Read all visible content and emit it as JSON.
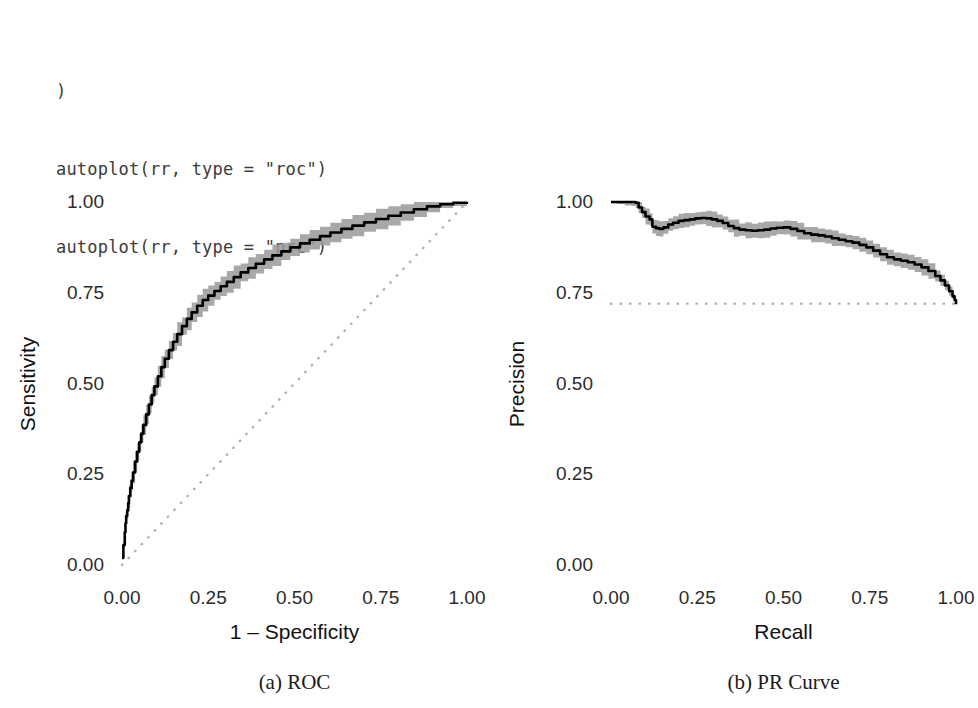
{
  "code": {
    "lines": [
      ")",
      "autoplot(rr, type = \"roc\")",
      "autoplot(rr, type = \"prc\")"
    ]
  },
  "colors": {
    "line": "#000000",
    "ribbon": "#999999",
    "reference_line": "#b0b0b0",
    "text": "#2b2b2b",
    "code_text": "#3b3b3b",
    "background": "#ffffff"
  },
  "figure": {
    "subcaptions": [
      {
        "label": "(a) ROC"
      },
      {
        "label": "(b) PR Curve"
      }
    ]
  },
  "chart_data": [
    {
      "type": "line",
      "panel": "a",
      "title": "(a) ROC",
      "xlabel": "1 – Specificity",
      "ylabel": "Sensitivity",
      "xlim": [
        0,
        1
      ],
      "ylim": [
        0,
        1
      ],
      "xticks": [
        "0.00",
        "0.25",
        "0.50",
        "0.75",
        "1.00"
      ],
      "yticks": [
        "0.00",
        "0.25",
        "0.50",
        "0.75",
        "1.00"
      ],
      "xtick_values": [
        0,
        0.25,
        0.5,
        0.75,
        1
      ],
      "ytick_values": [
        0,
        0.25,
        0.5,
        0.75,
        1
      ],
      "grid": false,
      "legend": "none",
      "reference_line": {
        "style": "dotted",
        "from": [
          0,
          0
        ],
        "to": [
          1,
          1
        ],
        "note": "chance diagonal"
      },
      "series": [
        {
          "name": "ROC curve",
          "style": "solid-black-with-grey-ribbon",
          "x": [
            0.0,
            0.004,
            0.008,
            0.01,
            0.012,
            0.015,
            0.018,
            0.02,
            0.024,
            0.028,
            0.032,
            0.038,
            0.044,
            0.05,
            0.056,
            0.062,
            0.07,
            0.078,
            0.086,
            0.094,
            0.104,
            0.114,
            0.124,
            0.136,
            0.148,
            0.16,
            0.174,
            0.188,
            0.202,
            0.218,
            0.234,
            0.25,
            0.268,
            0.286,
            0.304,
            0.324,
            0.344,
            0.366,
            0.388,
            0.412,
            0.436,
            0.462,
            0.488,
            0.516,
            0.544,
            0.574,
            0.604,
            0.636,
            0.668,
            0.702,
            0.736,
            0.772,
            0.808,
            0.846,
            0.884,
            0.922,
            0.96,
            1.0
          ],
          "y": [
            0.02,
            0.055,
            0.09,
            0.115,
            0.135,
            0.15,
            0.17,
            0.19,
            0.212,
            0.232,
            0.255,
            0.285,
            0.312,
            0.338,
            0.362,
            0.386,
            0.415,
            0.442,
            0.468,
            0.492,
            0.52,
            0.545,
            0.568,
            0.592,
            0.615,
            0.636,
            0.658,
            0.678,
            0.696,
            0.714,
            0.73,
            0.742,
            0.755,
            0.768,
            0.78,
            0.793,
            0.806,
            0.818,
            0.83,
            0.842,
            0.853,
            0.864,
            0.875,
            0.886,
            0.896,
            0.906,
            0.916,
            0.926,
            0.935,
            0.944,
            0.953,
            0.962,
            0.971,
            0.98,
            0.988,
            0.994,
            0.998,
            1.0
          ],
          "ribbon_halfwidth": 0.028
        }
      ]
    },
    {
      "type": "line",
      "panel": "b",
      "title": "(b) PR Curve",
      "xlabel": "Recall",
      "ylabel": "Precision",
      "xlim": [
        0,
        1
      ],
      "ylim": [
        0,
        1
      ],
      "xticks": [
        "0.00",
        "0.25",
        "0.50",
        "0.75",
        "1.00"
      ],
      "yticks": [
        "0.00",
        "0.25",
        "0.50",
        "0.75",
        "1.00"
      ],
      "xtick_values": [
        0,
        0.25,
        0.5,
        0.75,
        1
      ],
      "ytick_values": [
        0,
        0.25,
        0.5,
        0.75,
        1
      ],
      "grid": false,
      "legend": "none",
      "reference_line": {
        "style": "dotted",
        "from": [
          0,
          0.72
        ],
        "to": [
          1,
          0.72
        ],
        "note": "baseline prevalence"
      },
      "series": [
        {
          "name": "Precision-Recall curve",
          "style": "solid-black-with-grey-ribbon",
          "x": [
            0.0,
            0.02,
            0.04,
            0.06,
            0.072,
            0.08,
            0.09,
            0.1,
            0.112,
            0.12,
            0.13,
            0.14,
            0.152,
            0.166,
            0.18,
            0.196,
            0.212,
            0.228,
            0.244,
            0.26,
            0.276,
            0.292,
            0.308,
            0.324,
            0.34,
            0.356,
            0.372,
            0.39,
            0.408,
            0.426,
            0.444,
            0.462,
            0.48,
            0.5,
            0.52,
            0.54,
            0.56,
            0.58,
            0.6,
            0.62,
            0.64,
            0.66,
            0.68,
            0.7,
            0.72,
            0.74,
            0.76,
            0.78,
            0.8,
            0.82,
            0.84,
            0.86,
            0.88,
            0.9,
            0.92,
            0.94,
            0.955,
            0.968,
            0.98,
            0.99,
            0.996,
            1.0
          ],
          "y": [
            1.0,
            1.0,
            1.0,
            1.0,
            0.998,
            0.985,
            0.972,
            0.96,
            0.952,
            0.932,
            0.928,
            0.926,
            0.93,
            0.938,
            0.943,
            0.948,
            0.95,
            0.952,
            0.955,
            0.956,
            0.955,
            0.952,
            0.948,
            0.942,
            0.934,
            0.928,
            0.924,
            0.922,
            0.921,
            0.922,
            0.924,
            0.927,
            0.929,
            0.93,
            0.926,
            0.92,
            0.914,
            0.91,
            0.908,
            0.905,
            0.9,
            0.896,
            0.892,
            0.888,
            0.882,
            0.875,
            0.866,
            0.856,
            0.848,
            0.842,
            0.838,
            0.834,
            0.828,
            0.82,
            0.81,
            0.796,
            0.784,
            0.77,
            0.754,
            0.74,
            0.73,
            0.718
          ],
          "ribbon_halfwidth": 0.02
        }
      ]
    }
  ]
}
